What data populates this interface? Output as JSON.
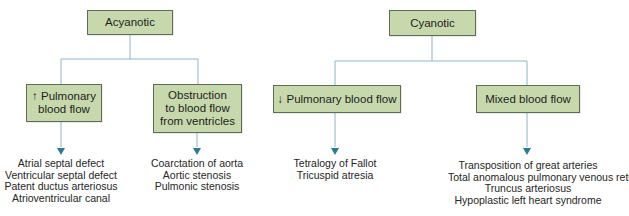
{
  "diagram": {
    "colors": {
      "box_fill": "#c6d8ac",
      "box_border": "#5e6b55",
      "connector": "#8fb3c9",
      "arrowhead": "#2b7a93"
    },
    "groups": [
      {
        "root": "Acyanotic",
        "branches": [
          {
            "label": "↑ Pulmonary\nblood flow",
            "items": [
              "Atrial septal defect",
              "Ventricular septal defect",
              "Patent ductus arteriosus",
              "Atrioventricular canal"
            ]
          },
          {
            "label": "Obstruction\nto blood flow\nfrom ventricles",
            "items": [
              "Coarctation of aorta",
              "Aortic stenosis",
              "Pulmonic stenosis"
            ]
          }
        ]
      },
      {
        "root": "Cyanotic",
        "branches": [
          {
            "label": "↓ Pulmonary blood flow",
            "items": [
              "Tetralogy of Fallot",
              "Tricuspid atresia"
            ]
          },
          {
            "label": "Mixed blood flow",
            "items": [
              "Transposition of great arteries",
              "Total anomalous pulmonary venous return",
              "Truncus arteriosus",
              "Hypoplastic left heart syndrome"
            ]
          }
        ]
      }
    ]
  }
}
